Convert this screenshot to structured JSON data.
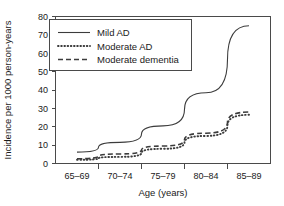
{
  "chart_data": {
    "type": "line",
    "title": "",
    "xlabel": "Age (years)",
    "ylabel": "Incidence per 1000 person-years",
    "categories": [
      "65–69",
      "70–74",
      "75–79",
      "80–84",
      "85–89"
    ],
    "x_tick_labels": [
      "65–69",
      "70–74",
      "75–79",
      "80–84",
      "85–89"
    ],
    "y_tick_labels": [
      "0",
      "10",
      "20",
      "30",
      "40",
      "50",
      "60",
      "70",
      "80"
    ],
    "y_ticks": [
      0,
      10,
      20,
      30,
      40,
      50,
      60,
      70,
      80
    ],
    "ylim": [
      0,
      80
    ],
    "grid": false,
    "legend_position": "upper left",
    "series": [
      {
        "name": "Mild AD",
        "style": "solid",
        "color": "#3c3c3c",
        "values": [
          6.2,
          11.5,
          20.5,
          38.5,
          75.0
        ]
      },
      {
        "name": "Moderate AD",
        "style": "dotted",
        "color": "#3c3c3c",
        "values": [
          2.0,
          3.6,
          8.0,
          15.0,
          26.5
        ]
      },
      {
        "name": "Moderate dementia",
        "style": "dashed",
        "color": "#3c3c3c",
        "values": [
          2.6,
          5.2,
          9.5,
          16.5,
          28.0
        ]
      }
    ]
  },
  "legend": {
    "items": [
      {
        "label": "Mild AD",
        "style": "solid"
      },
      {
        "label": "Moderate AD",
        "style": "dotted"
      },
      {
        "label": "Moderate dementia",
        "style": "dashed"
      }
    ]
  },
  "colors": {
    "axis": "#4a4a4a",
    "line": "#3c3c3c",
    "background": "#ffffff",
    "text": "#1a1a1a"
  }
}
